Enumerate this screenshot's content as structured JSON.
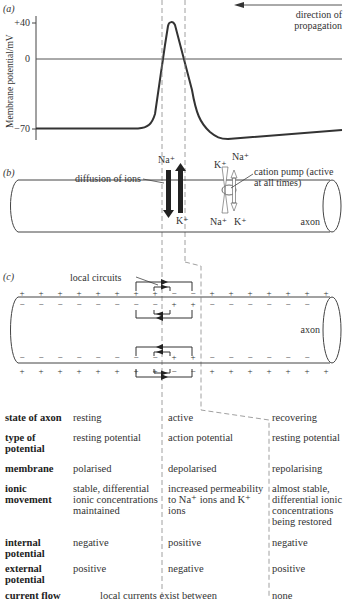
{
  "panel_a": {
    "label": "(a)",
    "ylabel": "Membrane potential/mV",
    "ticks": [
      "+40",
      "0",
      "−70"
    ],
    "direction_label_1": "direction of",
    "direction_label_2": "propagation",
    "line_color": "#333333"
  },
  "panel_b": {
    "label": "(b)",
    "diffusion_label": "diffusion of ions",
    "na_top": "Na⁺",
    "k_bottom": "K⁺",
    "pump_k_top": "K⁺",
    "pump_na_top": "Na⁺",
    "pump_na_bottom": "Na⁺",
    "pump_k_bottom": "K⁺",
    "pump_label_1": "cation pump (active",
    "pump_label_2": "at all times)",
    "axon_label": "axon"
  },
  "panel_c": {
    "label": "(c)",
    "local_circuits_label": "local circuits",
    "axon_label": "axon"
  },
  "table": {
    "rows": [
      {
        "header": "state of axon",
        "resting": "resting",
        "active": "active",
        "recovering": "recovering"
      },
      {
        "header": "type of potential",
        "resting": "resting potential",
        "active": "action potential",
        "recovering": "resting potential"
      },
      {
        "header": "membrane",
        "resting": "polarised",
        "active": "depolarised",
        "recovering": "repolarising"
      },
      {
        "header": "ionic movement",
        "resting": "stable, differential ionic concentrations maintained",
        "active": "increased permeability to Na⁺ ions and K⁺ ions",
        "recovering": "almost stable, differential ionic concentrations being restored"
      },
      {
        "header": "internal potential",
        "resting": "negative",
        "active": "positive",
        "recovering": "negative"
      },
      {
        "header": "external potential",
        "resting": "positive",
        "active": "negative",
        "recovering": "positive"
      },
      {
        "header": "current flow",
        "resting_active": "local currents exist between",
        "recovering": "none"
      }
    ]
  }
}
